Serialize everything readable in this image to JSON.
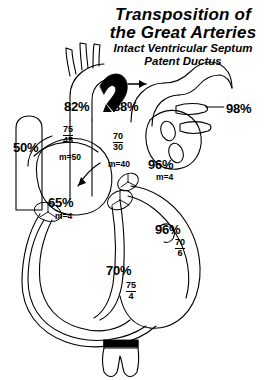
{
  "figure": {
    "title_lines": [
      "Transposition of",
      "the Great Arteries"
    ],
    "subtitle_lines": [
      "Intact Ventricular Septum",
      "Patent Ductus"
    ],
    "background_color": "#ffffff",
    "line_color": "#000000"
  },
  "labels": {
    "aorta_sat": "82%",
    "aorta_pressure_systolic": "75",
    "aorta_pressure_diastolic": "45",
    "aorta_mean": "m=50",
    "pulmonary_artery_sat": "88%",
    "pulmonary_artery_pressure_systolic": "70",
    "pulmonary_artery_pressure_diastolic": "30",
    "pulmonary_artery_mean": "m=40",
    "pulmonary_vein_sat": "98%",
    "left_atrium_sat": "96%",
    "left_atrium_mean": "m=4",
    "vena_cava_sat": "50%",
    "right_atrium_sat": "65%",
    "right_atrium_mean": "m=4",
    "left_ventricle_sat": "96%",
    "left_ventricle_pressure_systolic": "70",
    "left_ventricle_pressure_diastolic": "6",
    "right_ventricle_sat": "70%",
    "right_ventricle_pressure_systolic": "75",
    "right_ventricle_pressure_diastolic": "4"
  }
}
